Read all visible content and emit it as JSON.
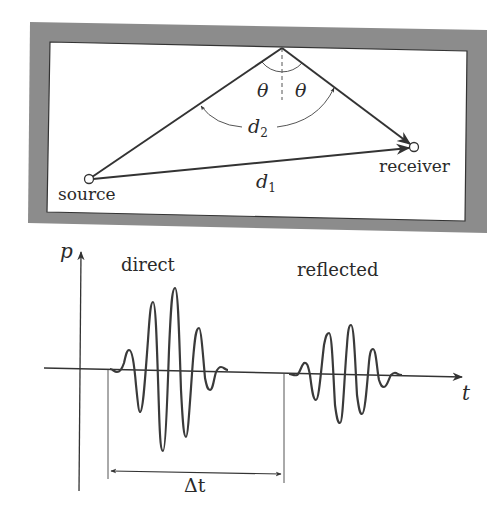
{
  "room": {
    "frame_color": "#8c8c8c",
    "inner_color": "#ffffff",
    "source_label": "source",
    "receiver_label": "receiver",
    "direct_path_label": "d",
    "direct_path_sub": "1",
    "reflected_path_label": "d",
    "reflected_path_sub": "2",
    "angle_label_left": "θ",
    "angle_label_right": "θ"
  },
  "signal_plot": {
    "y_axis_label": "p",
    "x_axis_label": "t",
    "direct_label": "direct",
    "reflected_label": "reflected",
    "delay_label": "Δt",
    "line_color": "#3a3a3a"
  }
}
